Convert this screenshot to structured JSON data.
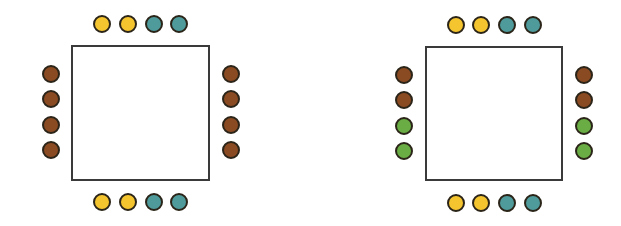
{
  "colors": {
    "yellow": "#F5C530",
    "teal": "#4F9A9B",
    "brown": "#8A4A22",
    "green": "#6AAD45",
    "outline": "#2b2418",
    "table_border": "#3a3a3a"
  },
  "arrangements": [
    {
      "name": "arrangement-left",
      "table": {
        "x": 71,
        "y": 45,
        "w": 139,
        "h": 136
      },
      "top": [
        "yellow",
        "yellow",
        "teal",
        "teal"
      ],
      "bottom": [
        "yellow",
        "yellow",
        "teal",
        "teal"
      ],
      "left": [
        "brown",
        "brown",
        "brown",
        "brown"
      ],
      "right": [
        "brown",
        "brown",
        "brown",
        "brown"
      ]
    },
    {
      "name": "arrangement-right",
      "table": {
        "x": 425,
        "y": 46,
        "w": 138,
        "h": 135
      },
      "top": [
        "yellow",
        "yellow",
        "teal",
        "teal"
      ],
      "bottom": [
        "yellow",
        "yellow",
        "teal",
        "teal"
      ],
      "left": [
        "brown",
        "brown",
        "green",
        "green"
      ],
      "right": [
        "brown",
        "brown",
        "green",
        "green"
      ]
    }
  ]
}
